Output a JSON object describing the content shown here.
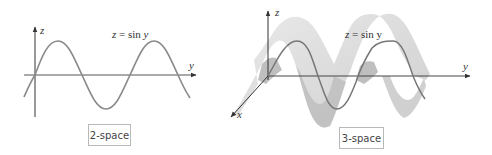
{
  "panels": [
    {
      "id": "2d",
      "caption": "2-space",
      "equation": {
        "lhs": "z",
        "eq": "=",
        "fn": "sin",
        "var": "y"
      },
      "axes": {
        "vertical": "z",
        "horizontal": "y"
      }
    },
    {
      "id": "3d",
      "caption": "3-space",
      "equation": {
        "lhs": "z",
        "eq": "=",
        "fn": "sin",
        "var": "y"
      },
      "axes": {
        "vertical": "z",
        "horizontal": "y",
        "depth": "x"
      }
    }
  ],
  "colors": {
    "axis": "#333333",
    "curve": "#7a7a7a",
    "surface": "#d6d6d6",
    "surface_dark": "#b5b5b5",
    "caption_border": "#b9b9b9"
  }
}
